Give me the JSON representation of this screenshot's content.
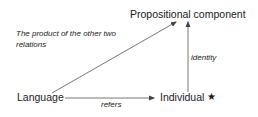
{
  "diagram": {
    "nodes": {
      "propositional_component": "Propositional component",
      "language": "Language",
      "individual": "Individual",
      "individual_marker": "★"
    },
    "edges": [
      {
        "from": "Language",
        "to": "Individual",
        "label": "refers"
      },
      {
        "from": "Individual",
        "to": "Propositional component",
        "label": "identity"
      },
      {
        "from": "Language",
        "to": "Propositional component",
        "label": "The product of the other two relations"
      }
    ],
    "labels": {
      "refers": "refers",
      "identity": "identity",
      "product_line1": "The product of the other two",
      "product_line2": "relations"
    },
    "colors": {
      "line": "#555555",
      "text": "#1a1a1a"
    }
  }
}
